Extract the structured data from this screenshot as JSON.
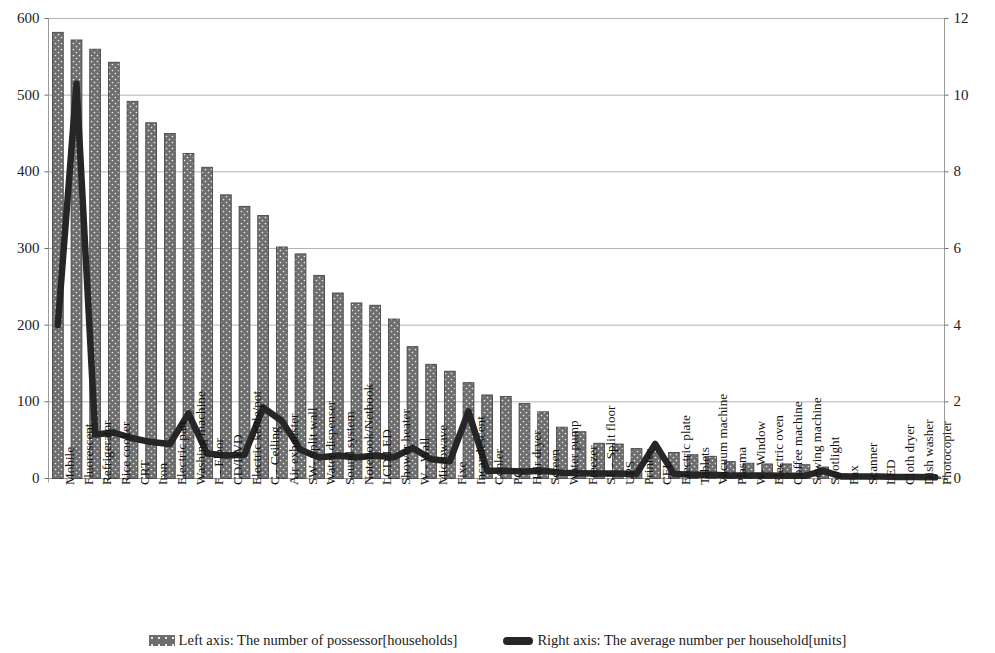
{
  "chart_data": {
    "type": "bar",
    "title": "",
    "subtitle": "",
    "xlabel": "",
    "ylabel": "",
    "y2label": "",
    "grid": true,
    "legend_position": "bottom",
    "ylim": [
      0,
      600
    ],
    "ytick_step": 100,
    "y2lim": [
      0,
      12
    ],
    "y2tick_step": 2,
    "yticks": [
      "0",
      "100",
      "200",
      "300",
      "400",
      "500",
      "600"
    ],
    "y2ticks": [
      "0",
      "2",
      "4",
      "6",
      "8",
      "10",
      "12"
    ],
    "categories": [
      "Mobile",
      "Fluorescent",
      "Refrigerator",
      "Rice cooker",
      "CRT",
      "Iron",
      "Electric pan",
      "Washing machine",
      "F - Floor",
      "CD/DVD",
      "Electric kettle/pot",
      "C - Ceiling",
      "Air exhauster",
      "SW- Split wall",
      "Water dispenser",
      "Sound system",
      "Notebook/Netbook",
      "LCD/LED",
      "Shower heater",
      "W - Wall",
      "Microwave",
      "Fixe",
      "Incandescent",
      "Cooler",
      "PC",
      "Hair dryer",
      "Screen",
      "Water pump",
      "Freezer",
      "SF - Split floor",
      "UPS",
      "Printer",
      "CFL",
      "Electric plate",
      "Tablets",
      "Vacuum machine",
      "Plasma",
      "W- Window",
      "Electric oven",
      "Coffee machine",
      "Sewing machine",
      "Spotlight",
      "Fax",
      "Scanner",
      "LED",
      "Cloth dryer",
      "Dish washer",
      "Photocopier"
    ],
    "series": [
      {
        "name": "Left axis: The number of possessor[households]",
        "axis": "left",
        "kind": "bar",
        "color": "#6e6e6e",
        "values": [
          582,
          572,
          560,
          543,
          492,
          464,
          450,
          424,
          406,
          370,
          355,
          343,
          302,
          293,
          265,
          242,
          229,
          226,
          208,
          172,
          149,
          140,
          125,
          109,
          107,
          98,
          87,
          67,
          61,
          46,
          45,
          39,
          37,
          34,
          31,
          29,
          22,
          20,
          19,
          19,
          18,
          15,
          6,
          5,
          4,
          3,
          3,
          2
        ]
      },
      {
        "name": "Right axis: The average number per household[units]",
        "axis": "right",
        "kind": "line",
        "color": "#262626",
        "values": [
          4.0,
          10.3,
          1.15,
          1.2,
          1.05,
          0.95,
          0.9,
          1.7,
          0.65,
          0.6,
          0.62,
          1.85,
          1.5,
          0.75,
          0.55,
          0.6,
          0.55,
          0.6,
          0.55,
          0.8,
          0.5,
          0.45,
          1.75,
          0.2,
          0.2,
          0.18,
          0.2,
          0.15,
          0.14,
          0.13,
          0.13,
          0.12,
          0.9,
          0.12,
          0.1,
          0.1,
          0.08,
          0.08,
          0.08,
          0.07,
          0.07,
          0.2,
          0.05,
          0.05,
          0.05,
          0.04,
          0.04,
          0.03
        ]
      }
    ]
  },
  "legend": {
    "items": [
      {
        "label": "Left axis: The number of possessor[households]",
        "marker": "bar-swatch"
      },
      {
        "label": "Right axis: The average number per household[units]",
        "marker": "line-swatch"
      }
    ]
  }
}
